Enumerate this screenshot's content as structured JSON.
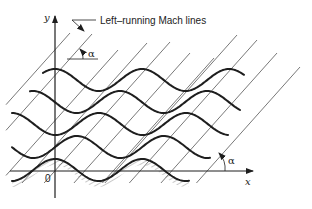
{
  "figure": {
    "annotation": "Left–running Mach lines",
    "y_axis_label": "y",
    "x_axis_label": "x",
    "origin_label": "0",
    "angle_label_top": "α",
    "angle_label_bottom": "α"
  },
  "colors": {
    "ink": "#1e1e1e",
    "mach_line": "#555555",
    "background": "#ffffff"
  },
  "geometry": {
    "wave_period": 87,
    "wave_amplitude": 11,
    "waves": [
      {
        "name": "streamline-1",
        "y_center": 80,
        "crest_x": 55,
        "x_start": 43,
        "x_end": 244
      },
      {
        "name": "streamline-2",
        "y_center": 102,
        "crest_x": 120,
        "x_start": 30,
        "x_end": 240
      },
      {
        "name": "streamline-3",
        "y_center": 124,
        "crest_x": 99,
        "x_start": 12,
        "x_end": 228
      },
      {
        "name": "streamline-4",
        "y_center": 147,
        "crest_x": 77,
        "x_start": 12,
        "x_end": 210
      },
      {
        "name": "wall",
        "y_center": 170,
        "crest_x": 55,
        "x_start": 12,
        "x_end": 190
      }
    ],
    "mach_line_tops": [
      [
        70,
        33
      ],
      [
        92,
        34
      ],
      [
        118,
        50
      ],
      [
        147,
        43
      ],
      [
        170,
        42
      ],
      [
        190,
        53
      ],
      [
        214,
        58
      ],
      [
        237,
        35
      ],
      [
        257,
        40
      ],
      [
        277,
        53
      ],
      [
        300,
        67
      ]
    ],
    "mach_line_slope": 1.12
  }
}
